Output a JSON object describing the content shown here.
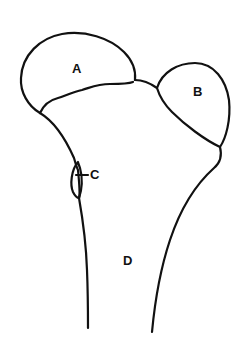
{
  "diagram": {
    "labels": {
      "a": "A",
      "b": "B",
      "c": "C",
      "d": "D"
    },
    "line_color": "#111111",
    "background": "#ffffff"
  }
}
